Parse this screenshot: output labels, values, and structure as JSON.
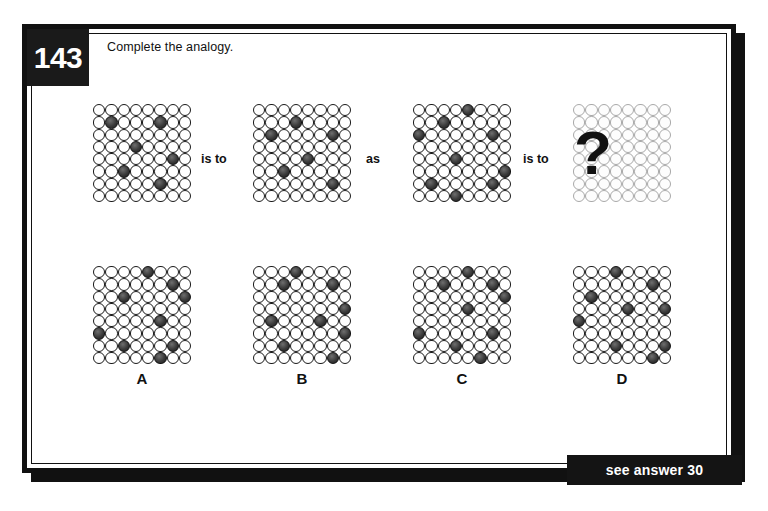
{
  "puzzle": {
    "number": "143",
    "prompt": "Complete the analogy.",
    "answer_banner": "see answer 30",
    "connectors": {
      "first": "is to",
      "middle": "as",
      "second": "is to"
    },
    "question_mark": "?"
  },
  "colors": {
    "frame": "#111111",
    "badge_bg": "#1a1a1a",
    "badge_text": "#ffffff",
    "cell_light": "#ffffff",
    "cell_dark": "#3a3a3a",
    "cell_stroke": "#1a1a1a",
    "faded_stroke": "#a9a9a9",
    "banner_bg": "#141414",
    "banner_text": "#ffffff",
    "page_bg": "#ffffff"
  },
  "grid_spec": {
    "rows": 8,
    "cols": 8,
    "note": "dark cell coordinates given as [row, col], zero-indexed from top-left"
  },
  "analogy": {
    "term_a": {
      "name": "grid-term-a",
      "dark": [
        [
          1,
          1
        ],
        [
          1,
          5
        ],
        [
          3,
          3
        ],
        [
          4,
          6
        ],
        [
          5,
          2
        ],
        [
          6,
          5
        ]
      ]
    },
    "term_b": {
      "name": "grid-term-b",
      "dark": [
        [
          1,
          3
        ],
        [
          2,
          1
        ],
        [
          2,
          6
        ],
        [
          4,
          4
        ],
        [
          5,
          2
        ],
        [
          6,
          6
        ]
      ]
    },
    "term_c": {
      "name": "grid-term-c",
      "dark": [
        [
          0,
          4
        ],
        [
          1,
          2
        ],
        [
          2,
          0
        ],
        [
          2,
          6
        ],
        [
          4,
          3
        ],
        [
          5,
          7
        ],
        [
          6,
          1
        ],
        [
          6,
          6
        ],
        [
          7,
          3
        ]
      ]
    },
    "term_d": {
      "name": "grid-term-d-unknown",
      "dark": [],
      "faded": true
    }
  },
  "options": [
    {
      "label": "A",
      "name": "option-a",
      "dark": [
        [
          0,
          4
        ],
        [
          1,
          6
        ],
        [
          2,
          2
        ],
        [
          2,
          7
        ],
        [
          4,
          5
        ],
        [
          5,
          0
        ],
        [
          6,
          2
        ],
        [
          6,
          6
        ],
        [
          7,
          5
        ]
      ]
    },
    {
      "label": "B",
      "name": "option-b",
      "dark": [
        [
          0,
          3
        ],
        [
          1,
          2
        ],
        [
          1,
          6
        ],
        [
          3,
          7
        ],
        [
          4,
          1
        ],
        [
          4,
          5
        ],
        [
          5,
          7
        ],
        [
          6,
          2
        ],
        [
          7,
          6
        ]
      ]
    },
    {
      "label": "C",
      "name": "option-c",
      "dark": [
        [
          0,
          4
        ],
        [
          1,
          2
        ],
        [
          1,
          6
        ],
        [
          2,
          7
        ],
        [
          3,
          4
        ],
        [
          5,
          0
        ],
        [
          5,
          6
        ],
        [
          6,
          3
        ],
        [
          7,
          5
        ]
      ]
    },
    {
      "label": "D",
      "name": "option-d",
      "dark": [
        [
          0,
          3
        ],
        [
          1,
          6
        ],
        [
          2,
          1
        ],
        [
          3,
          4
        ],
        [
          3,
          7
        ],
        [
          4,
          0
        ],
        [
          6,
          3
        ],
        [
          6,
          7
        ],
        [
          7,
          6
        ]
      ]
    }
  ]
}
